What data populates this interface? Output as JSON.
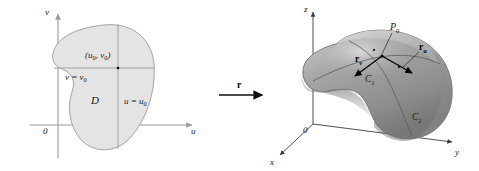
{
  "figure": {
    "caption": "",
    "left_panel": {
      "name": "parameter-domain",
      "axes": {
        "vertical_label": "v",
        "horizontal_label": "u",
        "origin_label": "0"
      },
      "region_label": "D",
      "point_label": "(u₀, v₀)",
      "point_label_base": "(u",
      "point_label_mid": ", v",
      "point_label_end": ")",
      "grid_line_v_label_base": "v = v",
      "grid_line_v_label_sub": "0",
      "grid_line_u_label_base": "u = u",
      "grid_line_u_label_sub": "0",
      "fill_color": "#e4e4e4",
      "stroke_color": "#9a9a9a"
    },
    "map_arrow": {
      "name": "map-arrow",
      "label": "r"
    },
    "right_panel": {
      "name": "surface-3d",
      "axes": {
        "z_label": "z",
        "y_label": "y",
        "x_label": "x",
        "origin_label": "0"
      },
      "point_label_base": "P",
      "point_label_sub": "0",
      "vector_v_base": "r",
      "vector_v_sub": "v",
      "vector_u_base": "r",
      "vector_u_sub": "u",
      "curve_1_base": "C",
      "curve_1_sub": "1",
      "curve_2_base": "C",
      "curve_2_sub": "2",
      "surface_color": "#9a9a9a",
      "surface_color_dark": "#6f6f6f",
      "surface_color_light": "#c9c9c9"
    }
  }
}
